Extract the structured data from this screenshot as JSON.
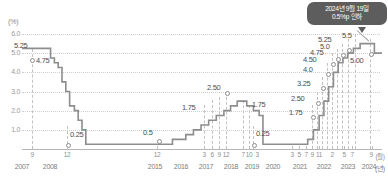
{
  "meta": {
    "unit_label": "(%)",
    "x_unit_month": "(월)",
    "x_unit_year": "(년)"
  },
  "callout": {
    "line1": "2024년 9월 19일",
    "line2": "0.5%p 인하",
    "bg_color": "#5d5d5d",
    "text_color": "#ffffff"
  },
  "colors": {
    "line": "#8d8d8d",
    "grid": "#cfcfcf",
    "dash": "#c2c2c2",
    "label": "#4d4d4d",
    "axis_text": "#8f8f8f"
  },
  "chart_data": {
    "type": "line",
    "title": "",
    "subtitle": "",
    "xlabel": "(년)",
    "ylabel": "(%)",
    "ylim": [
      0,
      6.0
    ],
    "grid": true,
    "legend": "none",
    "step": "post",
    "y_ticks": [
      "6.0",
      "5.0",
      "4.0",
      "3.0",
      "2.0",
      "1.0"
    ],
    "y_tick_values": [
      6.0,
      5.0,
      4.0,
      3.0,
      2.0,
      1.0
    ],
    "axis_breaks": [
      {
        "after_year": "2008",
        "before_year": "2015"
      },
      {
        "after_year": "2020",
        "before_year": "2021"
      }
    ],
    "x_month_ticks": [
      "9",
      "12",
      "12",
      "3",
      "6",
      "9",
      "12",
      "7",
      "10",
      "3",
      "3",
      "5",
      "7",
      "9",
      "11",
      "2",
      "5",
      "7",
      "9"
    ],
    "x_year_ticks": [
      "2007",
      "2008",
      "2015",
      "2016",
      "2017",
      "2018",
      "2019",
      "2020",
      "2021",
      "2022",
      "2023",
      "2024"
    ],
    "data_labels": [
      {
        "text": "5.25",
        "value": 5.25
      },
      {
        "text": "4.75",
        "value": 4.75
      },
      {
        "text": "0.25",
        "value": 0.25
      },
      {
        "text": "0.5",
        "value": 0.5
      },
      {
        "text": "1.75",
        "value": 1.75
      },
      {
        "text": "2.50",
        "value": 2.5
      },
      {
        "text": "1.75",
        "value": 1.75
      },
      {
        "text": "0.25",
        "value": 0.25
      },
      {
        "text": "1.75",
        "value": 1.75
      },
      {
        "text": "2.50",
        "value": 2.5
      },
      {
        "text": "3.25",
        "value": 3.25
      },
      {
        "text": "4.0",
        "value": 4.0
      },
      {
        "text": "4.50",
        "value": 4.5
      },
      {
        "text": "4.75",
        "value": 4.75
      },
      {
        "text": "5.0",
        "value": 5.0
      },
      {
        "text": "5.25",
        "value": 5.25
      },
      {
        "text": "5.5",
        "value": 5.5
      },
      {
        "text": "5.00",
        "value": 5.0
      }
    ],
    "series": [
      {
        "name": "미국 기준금리",
        "points": [
          {
            "x": 0,
            "y": 5.25
          },
          {
            "x": 24,
            "y": 5.25
          },
          {
            "x": 30,
            "y": 4.75
          },
          {
            "x": 34,
            "y": 4.5
          },
          {
            "x": 38,
            "y": 4.25
          },
          {
            "x": 42,
            "y": 3.5
          },
          {
            "x": 46,
            "y": 3.0
          },
          {
            "x": 50,
            "y": 2.25
          },
          {
            "x": 55,
            "y": 2.0
          },
          {
            "x": 59,
            "y": 1.5
          },
          {
            "x": 63,
            "y": 1.0
          },
          {
            "x": 67,
            "y": 0.25
          },
          {
            "x": 150,
            "y": 0.25
          },
          {
            "x": 158,
            "y": 0.5
          },
          {
            "x": 172,
            "y": 0.75
          },
          {
            "x": 180,
            "y": 1.0
          },
          {
            "x": 188,
            "y": 1.25
          },
          {
            "x": 196,
            "y": 1.5
          },
          {
            "x": 204,
            "y": 1.75
          },
          {
            "x": 212,
            "y": 2.0
          },
          {
            "x": 219,
            "y": 2.25
          },
          {
            "x": 226,
            "y": 2.5
          },
          {
            "x": 236,
            "y": 2.25
          },
          {
            "x": 243,
            "y": 2.0
          },
          {
            "x": 249,
            "y": 1.75
          },
          {
            "x": 253,
            "y": 0.25
          },
          {
            "x": 292,
            "y": 0.25
          },
          {
            "x": 300,
            "y": 0.5
          },
          {
            "x": 306,
            "y": 1.0
          },
          {
            "x": 312,
            "y": 1.75
          },
          {
            "x": 317,
            "y": 2.5
          },
          {
            "x": 322,
            "y": 3.25
          },
          {
            "x": 327,
            "y": 4.0
          },
          {
            "x": 332,
            "y": 4.5
          },
          {
            "x": 337,
            "y": 4.75
          },
          {
            "x": 342,
            "y": 5.0
          },
          {
            "x": 348,
            "y": 5.25
          },
          {
            "x": 355,
            "y": 5.5
          },
          {
            "x": 370,
            "y": 5.5
          },
          {
            "x": 370,
            "y": 5.0
          },
          {
            "x": 378,
            "y": 5.0
          }
        ]
      }
    ]
  }
}
